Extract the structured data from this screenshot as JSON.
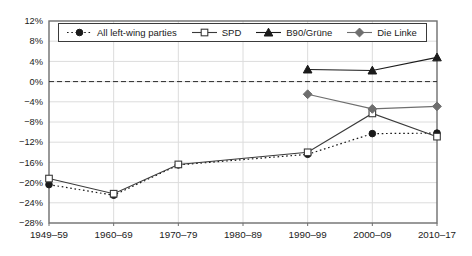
{
  "chart_data": {
    "type": "line",
    "title": "",
    "xlabel": "",
    "ylabel": "",
    "ylim": [
      -28,
      12
    ],
    "grid": true,
    "zero_line_dashed": true,
    "legend_position": "top-left-inside",
    "categories": [
      "1949–59",
      "1960–69",
      "1970–79",
      "1980–89",
      "1990–99",
      "2000–09",
      "2010–17"
    ],
    "y_ticks": [
      {
        "value": 12,
        "label": "12%"
      },
      {
        "value": 8,
        "label": "8%"
      },
      {
        "value": 4,
        "label": "4%"
      },
      {
        "value": 0,
        "label": "0%"
      },
      {
        "value": -4,
        "label": "−4%"
      },
      {
        "value": -8,
        "label": "−8%"
      },
      {
        "value": -12,
        "label": "−12%"
      },
      {
        "value": -16,
        "label": "−16%"
      },
      {
        "value": -20,
        "label": "−20%"
      },
      {
        "value": -24,
        "label": "−24%"
      },
      {
        "value": -28,
        "label": "−28%"
      }
    ],
    "series": [
      {
        "name": "All left-wing parties",
        "marker": "circle",
        "line": "dotted",
        "color": "#1a1a1a",
        "marker_fill": "#1a1a1a",
        "values": [
          -20.4,
          -22.5,
          -16.5,
          null,
          -14.4,
          -10.3,
          -10.2
        ]
      },
      {
        "name": "SPD",
        "marker": "square",
        "line": "solid",
        "color": "#3a3a3a",
        "marker_fill": "#ffffff",
        "values": [
          -19.2,
          -22.2,
          -16.4,
          null,
          -14.0,
          -6.3,
          -10.9
        ]
      },
      {
        "name": "B90/Grüne",
        "marker": "triangle",
        "line": "solid",
        "color": "#1a1a1a",
        "marker_fill": "#1a1a1a",
        "values": [
          null,
          null,
          null,
          null,
          2.4,
          2.2,
          4.8
        ]
      },
      {
        "name": "Die Linke",
        "marker": "diamond",
        "line": "solid",
        "color": "#6e6e6e",
        "marker_fill": "#6e6e6e",
        "values": [
          null,
          null,
          null,
          null,
          -2.5,
          -5.4,
          -4.9
        ]
      }
    ],
    "colors": {
      "grid": "#dcdcdc",
      "frame": "#6e6e6e",
      "zero_line": "#2a2a2a",
      "text": "#1a1a1a"
    }
  }
}
